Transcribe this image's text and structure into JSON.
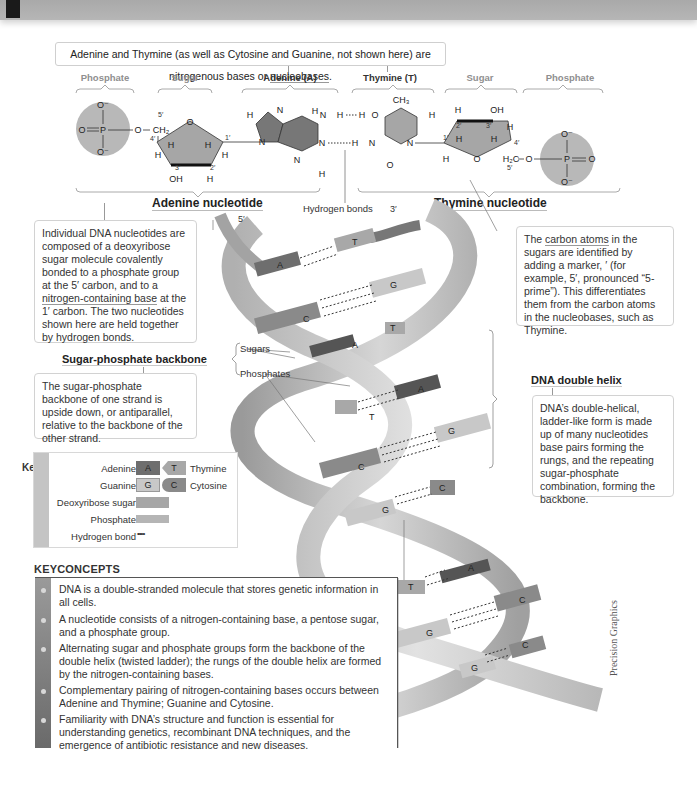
{
  "header": {
    "title": ""
  },
  "intro": {
    "text_before": "Adenine and Thymine (as well as Cytosine and Guanine, not shown here) are nitrogenous bases or ",
    "term": "nucleobases",
    "text_after": "."
  },
  "molecule": {
    "parts": [
      {
        "label": "Phosphate",
        "style": "faint"
      },
      {
        "label": "Sugar",
        "style": "faint"
      },
      {
        "label": "Adenine (A)",
        "style": "strong"
      },
      {
        "label": "Thymine (T)",
        "style": "strong"
      },
      {
        "label": "Sugar",
        "style": "faint"
      },
      {
        "label": "Phosphate",
        "style": "faint"
      }
    ],
    "adenine_nucleotide_label": "Adenine nucleotide",
    "thymine_nucleotide_label": "Thymine nucleotide",
    "hydrogen_bonds_label": "Hydrogen bonds",
    "atoms": {
      "O": "O",
      "O_minus": "O⁻",
      "P": "P",
      "H": "H",
      "N": "N",
      "OH": "OH",
      "CH2": "CH₂",
      "H2C": "H₂C",
      "CH3": "CH₃",
      "p1": "1′",
      "p2": "2′",
      "p3": "3′",
      "p4": "4′",
      "p5": "5′"
    }
  },
  "helix": {
    "end_5prime": "5′",
    "end_3prime": "3′",
    "sugars_label": "Sugars",
    "phosphates_label": "Phosphates",
    "base_pairs": [
      {
        "left": "A",
        "right": "T"
      },
      {
        "left": "C",
        "right": "G"
      },
      {
        "left": "A",
        "right": "T"
      },
      {
        "left": "T",
        "right": "A"
      },
      {
        "left": "C",
        "right": "G"
      },
      {
        "left": "G",
        "right": "C"
      },
      {
        "left": "T",
        "right": "A"
      },
      {
        "left": "G",
        "right": "C"
      },
      {
        "left": "G",
        "right": "C"
      }
    ]
  },
  "callouts": {
    "nucleotides": {
      "before": "Individual DNA nucleotides are composed of a deoxyribose sugar molecule covalently bonded to a phosphate group at the 5′ carbon, and to a ",
      "term": "nitrogen-containing base",
      "after": " at the 1′ carbon. The two nucleotides shown here are held together by hydrogen bonds."
    },
    "backbone_heading": "Sugar-phosphate backbone",
    "backbone_text": "The sugar-phosphate backbone of one strand is upside down, or antiparallel, relative to the backbone of the other strand.",
    "carbon": {
      "before": "The ",
      "term": "carbon atoms",
      "after": " in the sugars are identified by adding a marker, ′ (for example, 5′, pronounced “5-prime”). This differentiates them from the carbon atoms in the nucleobases, such as Thymine."
    },
    "helix_heading": "DNA double helix",
    "helix_text": "DNA’s double-helical, ladder-like form is made up of many nucleotides base pairs forming the rungs, and the repeating sugar-phosphate combination, forming the backbone."
  },
  "key": {
    "tag": "Key",
    "rows": [
      {
        "left_label": "Adenine",
        "left_letter": "A",
        "right_letter": "T",
        "right_label": "Thymine"
      },
      {
        "left_label": "Guanine",
        "left_letter": "G",
        "right_letter": "C",
        "right_label": "Cytosine"
      }
    ],
    "deoxyribose_label": "Deoxyribose sugar",
    "phosphate_label": "Phosphate",
    "hbond_label": "Hydrogen bond",
    "hbond_symbol": "••••"
  },
  "key_concepts": {
    "title": "KEYCONCEPTS",
    "items": [
      "DNA is a double-stranded molecule that stores genetic information in all cells.",
      "A nucleotide consists of a nitrogen-containing base, a pentose sugar, and a phosphate group.",
      "Alternating sugar and phosphate groups form the backbone of the double helix (twisted ladder); the rungs of the double helix are formed by the nitrogen-containing bases.",
      "Complementary pairing of nitrogen-containing bases occurs between Adenine and Thymine; Guanine and Cytosine.",
      "Familiarity with DNA’s structure and function is essential for understanding genetics, recombinant DNA techniques, and the emergence of antibiotic resistance and new diseases."
    ]
  },
  "credit": "Precision Graphics",
  "colors": {
    "adenine": "#6e6e6e",
    "thymine": "#a8a8a8",
    "guanine": "#c8c8c8",
    "cytosine": "#8a8a8a",
    "sugar_fill": "#a6a6a6",
    "phosphate_fill": "#b5b5b5",
    "backbone": "#bdbdbd",
    "header": "#b0b0b0"
  }
}
